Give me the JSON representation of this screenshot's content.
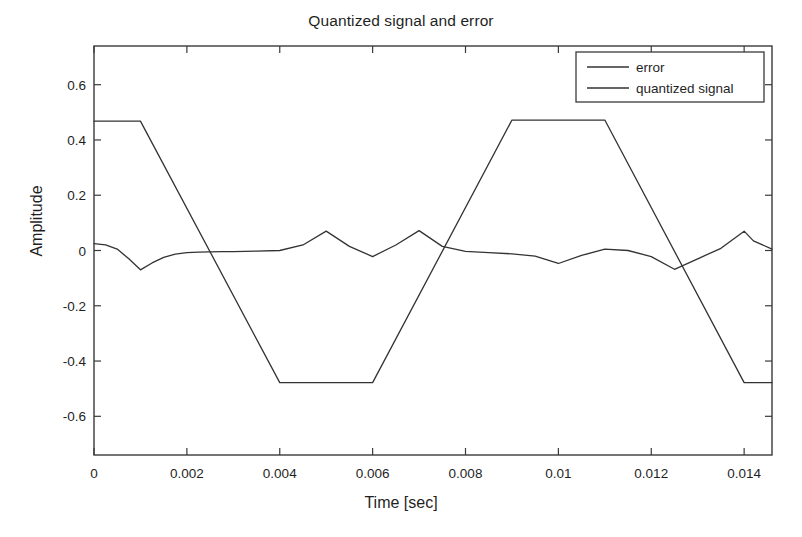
{
  "chart_data": {
    "type": "line",
    "title": "Quantized signal and error",
    "xlabel": "Time [sec]",
    "ylabel": "Amplitude",
    "xlim": [
      0,
      0.0146
    ],
    "ylim": [
      -0.74,
      0.74
    ],
    "grid": false,
    "legend_position": "upper right",
    "xticks": [
      0,
      0.002,
      0.004,
      0.006,
      0.008,
      0.01,
      0.012,
      0.014
    ],
    "xtick_labels": [
      "0",
      "0.002",
      "0.004",
      "0.006",
      "0.008",
      "0.01",
      "0.012",
      "0.014"
    ],
    "yticks": [
      0.6,
      0.4,
      0.2,
      0,
      -0.2,
      -0.4,
      -0.6
    ],
    "ytick_labels": [
      "0.6",
      "0.4",
      "0.2",
      "0",
      "-0.2",
      "-0.4",
      "-0.6"
    ],
    "series": [
      {
        "name": "error",
        "color": "#333333",
        "x": [
          0.0,
          0.00025,
          0.0005,
          0.00075,
          0.001,
          0.00125,
          0.0015,
          0.00175,
          0.002,
          0.00225,
          0.0025,
          0.00275,
          0.003,
          0.0035,
          0.004,
          0.0045,
          0.005,
          0.0055,
          0.006,
          0.0065,
          0.007,
          0.0075,
          0.008,
          0.0085,
          0.009,
          0.0095,
          0.01,
          0.0105,
          0.011,
          0.0115,
          0.012,
          0.0125,
          0.013,
          0.0135,
          0.014,
          0.0142,
          0.0146
        ],
        "y": [
          0.025,
          0.02,
          0.005,
          -0.03,
          -0.07,
          -0.045,
          -0.025,
          -0.013,
          -0.008,
          -0.006,
          -0.005,
          -0.004,
          -0.004,
          -0.002,
          0.0,
          0.02,
          0.07,
          0.015,
          -0.022,
          0.02,
          0.072,
          0.015,
          -0.003,
          -0.008,
          -0.012,
          -0.02,
          -0.047,
          -0.018,
          0.005,
          0.0,
          -0.022,
          -0.068,
          -0.03,
          0.008,
          0.07,
          0.035,
          0.005
        ]
      },
      {
        "name": "quantized signal",
        "color": "#333333",
        "x": [
          0.0,
          0.001,
          0.004,
          0.006,
          0.009,
          0.011,
          0.014,
          0.0146
        ],
        "y": [
          0.468,
          0.468,
          -0.478,
          -0.478,
          0.472,
          0.472,
          -0.478,
          -0.478
        ]
      }
    ]
  },
  "legend": {
    "items": [
      {
        "label": "error"
      },
      {
        "label": "quantized signal"
      }
    ]
  },
  "style": {
    "axis_color": "#3a3a3a",
    "text_color": "#1f1f1f",
    "background": "#ffffff"
  }
}
